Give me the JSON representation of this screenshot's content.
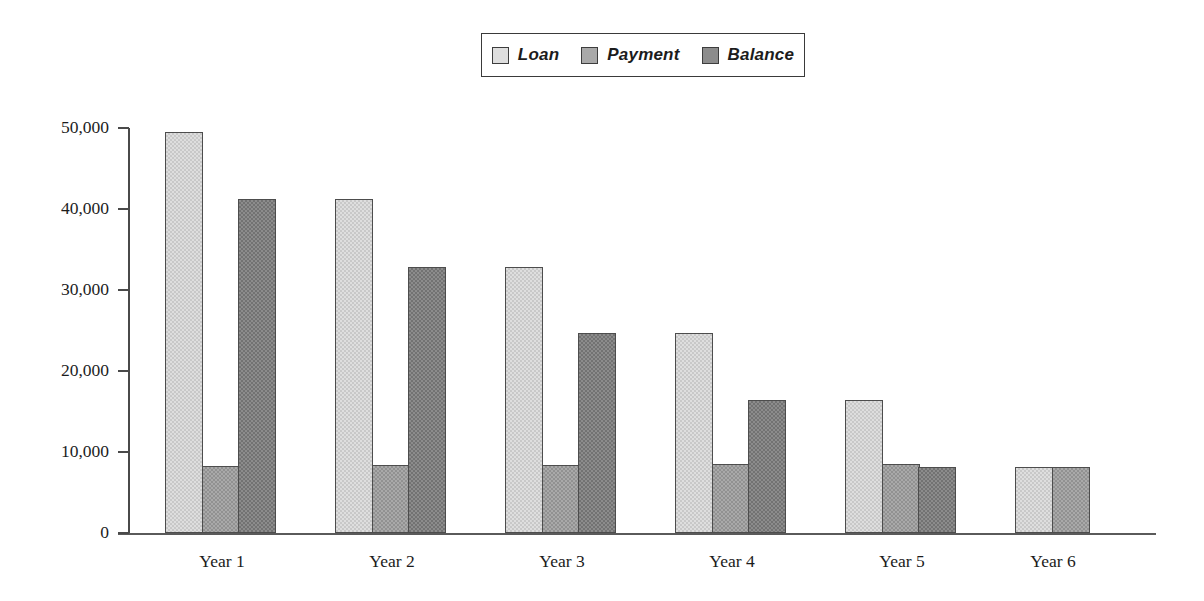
{
  "chart_data": {
    "type": "bar",
    "title": "",
    "xlabel": "",
    "ylabel": "",
    "categories": [
      "Year 1",
      "Year 2",
      "Year 3",
      "Year 4",
      "Year 5",
      "Year 6"
    ],
    "series": [
      {
        "name": "Loan",
        "color": "#dedede",
        "values": [
          49500,
          41200,
          32900,
          24700,
          16400,
          8100
        ]
      },
      {
        "name": "Payment",
        "color": "#a9a9a9",
        "values": [
          8300,
          8400,
          8400,
          8500,
          8500,
          8100
        ]
      },
      {
        "name": "Balance",
        "color": "#8c8c8c",
        "values": [
          41200,
          32900,
          24700,
          16400,
          8100,
          null
        ]
      }
    ],
    "ylim": [
      0,
      50000
    ],
    "yticks": [
      0,
      10000,
      20000,
      30000,
      40000,
      50000
    ],
    "ytick_labels": [
      "0",
      "10,000",
      "20,000",
      "30,000",
      "40,000",
      "50,000"
    ],
    "grid": false,
    "legend_position": "top-center"
  },
  "legend": {
    "entries": [
      {
        "label": "Loan",
        "swatch_color": "#dedede"
      },
      {
        "label": "Payment",
        "swatch_color": "#a9a9a9"
      },
      {
        "label": "Balance",
        "swatch_color": "#8c8c8c"
      }
    ]
  },
  "axes": {
    "y_tick_labels": [
      "50,000",
      "40,000",
      "30,000",
      "20,000",
      "10,000",
      "0"
    ],
    "x_tick_labels": [
      "Year 1",
      "Year 2",
      "Year 3",
      "Year 4",
      "Year 5",
      "Year 6"
    ]
  }
}
